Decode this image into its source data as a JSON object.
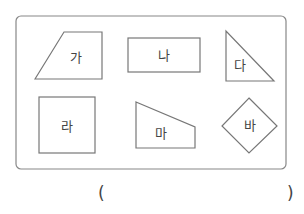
{
  "shapes": [
    {
      "id": "ga",
      "label": "가",
      "type": "trapezoid"
    },
    {
      "id": "na",
      "label": "나",
      "type": "rectangle"
    },
    {
      "id": "da",
      "label": "다",
      "type": "right-triangle"
    },
    {
      "id": "ra",
      "label": "라",
      "type": "square"
    },
    {
      "id": "ma",
      "label": "마",
      "type": "right-trapezoid"
    },
    {
      "id": "ba",
      "label": "바",
      "type": "rhombus"
    }
  ],
  "answer": {
    "open": "(",
    "close": ")",
    "value": ""
  },
  "colors": {
    "stroke": "#777777",
    "text": "#444444"
  }
}
